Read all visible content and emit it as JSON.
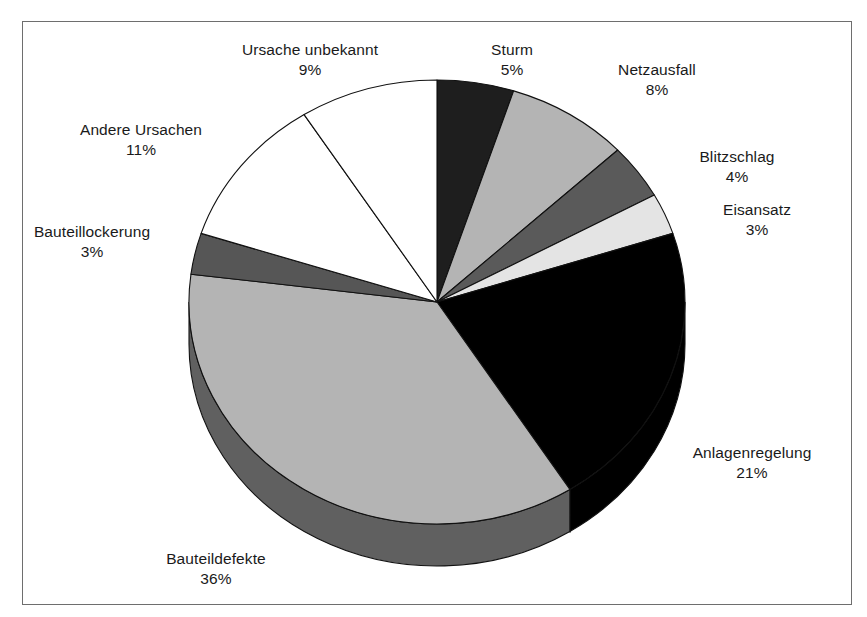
{
  "figure": {
    "background_color": "#ffffff",
    "frame_color": "#6e6e6e",
    "label_color": "#1a1a1a"
  },
  "chart_data": {
    "type": "pie",
    "title": "",
    "subtitle": "",
    "xlabel": "",
    "ylabel": "",
    "legend_position": "none",
    "grid": false,
    "three_d": true,
    "start_angle_deg": 0,
    "direction": "clockwise",
    "units": "%",
    "categories": [
      "Sturm",
      "Netzausfall",
      "Blitzschlag",
      "Eisansatz",
      "Anlagenregelung",
      "Bauteildefekte",
      "Bauteillockerung",
      "Andere Ursachen",
      "Ursache unbekannt"
    ],
    "values": [
      5,
      8,
      4,
      3,
      21,
      36,
      3,
      11,
      9
    ],
    "value_labels": [
      "5%",
      "8%",
      "4%",
      "3%",
      "21%",
      "36%",
      "3%",
      "11%",
      "9%"
    ],
    "total": 100,
    "slice_colors": [
      "#1e1e1e",
      "#b4b4b4",
      "#5a5a5a",
      "#e4e4e4",
      "#000000",
      "#b4b4b4",
      "#565656",
      "#ffffff",
      "#ffffff"
    ],
    "slice_side_colors": [
      "#131313",
      "#6a6a6a",
      "#3a3a3a",
      "#8e8e8e",
      "#000000",
      "#606060",
      "#343434",
      "#9a9a9a",
      "#9a9a9a"
    ],
    "slices": [
      {
        "label": "Sturm",
        "value": 5,
        "value_label": "5%",
        "color": "#1e1e1e",
        "side_color": "#131313"
      },
      {
        "label": "Netzausfall",
        "value": 8,
        "value_label": "8%",
        "color": "#b4b4b4",
        "side_color": "#6a6a6a"
      },
      {
        "label": "Blitzschlag",
        "value": 4,
        "value_label": "4%",
        "color": "#5a5a5a",
        "side_color": "#3a3a3a"
      },
      {
        "label": "Eisansatz",
        "value": 3,
        "value_label": "3%",
        "color": "#e4e4e4",
        "side_color": "#8e8e8e"
      },
      {
        "label": "Anlagenregelung",
        "value": 21,
        "value_label": "21%",
        "color": "#000000",
        "side_color": "#000000"
      },
      {
        "label": "Bauteildefekte",
        "value": 36,
        "value_label": "36%",
        "color": "#b4b4b4",
        "side_color": "#606060"
      },
      {
        "label": "Bauteillockerung",
        "value": 3,
        "value_label": "3%",
        "color": "#565656",
        "side_color": "#343434"
      },
      {
        "label": "Andere Ursachen",
        "value": 11,
        "value_label": "11%",
        "color": "#ffffff",
        "side_color": "#9a9a9a"
      },
      {
        "label": "Ursache unbekannt",
        "value": 9,
        "value_label": "9%",
        "color": "#ffffff",
        "side_color": "#9a9a9a"
      }
    ]
  },
  "labels": [
    {
      "name": "Ursache unbekannt",
      "pct": "9%",
      "x": 310,
      "y": 40,
      "anchor": "mid"
    },
    {
      "name": "Sturm",
      "pct": "5%",
      "x": 512,
      "y": 40,
      "anchor": "mid"
    },
    {
      "name": "Netzausfall",
      "pct": "8%",
      "x": 657,
      "y": 60,
      "anchor": "mid"
    },
    {
      "name": "Blitzschlag",
      "pct": "4%",
      "x": 737,
      "y": 147,
      "anchor": "mid"
    },
    {
      "name": "Eisansatz",
      "pct": "3%",
      "x": 757,
      "y": 200,
      "anchor": "mid"
    },
    {
      "name": "Anlagenregelung",
      "pct": "21%",
      "x": 752,
      "y": 443,
      "anchor": "mid"
    },
    {
      "name": "Bauteildefekte",
      "pct": "36%",
      "x": 216,
      "y": 549,
      "anchor": "mid"
    },
    {
      "name": "Bauteillockerung",
      "pct": "3%",
      "x": 92,
      "y": 222,
      "anchor": "mid"
    },
    {
      "name": "Andere Ursachen",
      "pct": "11%",
      "x": 141,
      "y": 120,
      "anchor": "mid"
    }
  ],
  "geometry": {
    "cx": 437,
    "cy": 302,
    "rx": 248,
    "ry": 222,
    "depth": 42,
    "outline_color": "#111111"
  }
}
